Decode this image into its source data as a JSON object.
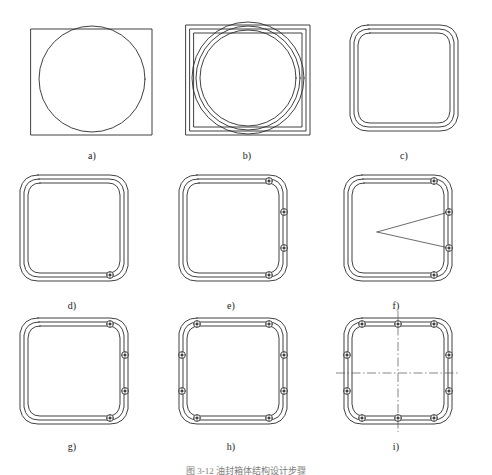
{
  "figure": {
    "caption": "图 3-12   油封箱体结构设计步骤",
    "background_color": "#ffffff",
    "line_color": "#2b2b2b",
    "centerline_color": "#555555",
    "panels": [
      {
        "id": "a",
        "label": "a)",
        "label_x": 92,
        "label_y": 150,
        "description": "rectangle overlapped by circle",
        "elements": [
          "rectangle-outline",
          "circle-outline"
        ],
        "bolt_count": 0
      },
      {
        "id": "b",
        "label": "b)",
        "label_x": 247,
        "label_y": 150,
        "description": "three nested rectangles with three nested circles",
        "elements": [
          "rectangle-outline-x3",
          "circle-outline-x3"
        ],
        "bolt_count": 0
      },
      {
        "id": "c",
        "label": "c)",
        "label_x": 404,
        "label_y": 150,
        "description": "barrel outline with three concentric contours",
        "elements": [
          "barrel-outline-x3"
        ],
        "bolt_count": 0
      },
      {
        "id": "d",
        "label": "d)",
        "label_x": 72,
        "label_y": 300,
        "description": "barrel outline with single bolt hole at lower right",
        "elements": [
          "barrel-outline-x3",
          "bolt-holes"
        ],
        "bolt_count": 1
      },
      {
        "id": "e",
        "label": "e)",
        "label_x": 231,
        "label_y": 300,
        "description": "barrel outline with four bolt holes on right flank",
        "elements": [
          "barrel-outline-x3",
          "bolt-holes"
        ],
        "bolt_count": 4
      },
      {
        "id": "f",
        "label": "f)",
        "label_x": 396,
        "label_y": 300,
        "description": "barrel outline, four bolt holes and two construction lines converging to an apex",
        "elements": [
          "barrel-outline-x3",
          "bolt-holes",
          "construction-lines"
        ],
        "bolt_count": 4
      },
      {
        "id": "g",
        "label": "g)",
        "label_x": 72,
        "label_y": 441,
        "description": "barrel outline with four bolt holes on right flank, refined contour",
        "elements": [
          "barrel-outline-x3",
          "bolt-holes"
        ],
        "bolt_count": 4
      },
      {
        "id": "h",
        "label": "h)",
        "label_x": 231,
        "label_y": 441,
        "description": "barrel outline with eight symmetric bolt holes",
        "elements": [
          "barrel-outline-x3",
          "bolt-holes"
        ],
        "bolt_count": 8
      },
      {
        "id": "i",
        "label": "i)",
        "label_x": 396,
        "label_y": 441,
        "description": "finished barrel outline with ten bolt holes and dash-dot centre lines",
        "elements": [
          "barrel-outline-x3",
          "bolt-holes",
          "centre-lines"
        ],
        "bolt_count": 10
      }
    ]
  }
}
